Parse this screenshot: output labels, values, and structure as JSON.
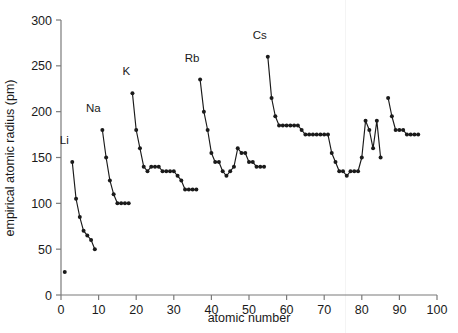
{
  "chart_data": {
    "type": "scatter",
    "title": "",
    "xlabel": "atomic number",
    "ylabel": "empirical atomic radius (pm)",
    "xlim": [
      0,
      100
    ],
    "ylim": [
      0,
      300
    ],
    "xticks": [
      0,
      10,
      20,
      30,
      40,
      50,
      60,
      70,
      80,
      90,
      100
    ],
    "yticks": [
      0,
      50,
      100,
      150,
      200,
      250,
      300
    ],
    "xtick_labels": [
      "0",
      "10",
      "20",
      "30",
      "40",
      "50",
      "60",
      "70",
      "80",
      "90",
      "100"
    ],
    "ytick_labels": [
      "0",
      "50",
      "100",
      "150",
      "200",
      "250",
      "300"
    ],
    "grid": false,
    "legend": null,
    "marker": "filled-circle",
    "marker_color": "#1a1a1a",
    "line_color": "#1a1a1a",
    "axis_color": "#7b7b7b",
    "annotations": [
      {
        "text": "Li",
        "x": 3,
        "y": 145,
        "dx": -8,
        "dy": -18
      },
      {
        "text": "Na",
        "x": 11,
        "y": 180,
        "dx": -9,
        "dy": -18
      },
      {
        "text": "K",
        "x": 19,
        "y": 220,
        "dx": -6,
        "dy": -18
      },
      {
        "text": "Rb",
        "x": 37,
        "y": 235,
        "dx": -8,
        "dy": -18
      },
      {
        "text": "Cs",
        "x": 55,
        "y": 260,
        "dx": -8,
        "dy": -18
      }
    ],
    "series": [
      {
        "name": "hydrogen",
        "connected": false,
        "points": [
          [
            1,
            25
          ]
        ]
      },
      {
        "name": "period-2",
        "connected": true,
        "points": [
          [
            3,
            145
          ],
          [
            4,
            105
          ],
          [
            5,
            85
          ],
          [
            6,
            70
          ],
          [
            7,
            65
          ],
          [
            8,
            60
          ],
          [
            9,
            50
          ]
        ]
      },
      {
        "name": "period-3",
        "connected": true,
        "points": [
          [
            11,
            180
          ],
          [
            12,
            150
          ],
          [
            13,
            125
          ],
          [
            14,
            110
          ],
          [
            15,
            100
          ],
          [
            16,
            100
          ],
          [
            17,
            100
          ],
          [
            18,
            100
          ]
        ]
      },
      {
        "name": "period-4",
        "connected": true,
        "points": [
          [
            19,
            220
          ],
          [
            20,
            180
          ],
          [
            21,
            160
          ],
          [
            22,
            140
          ],
          [
            23,
            135
          ],
          [
            24,
            140
          ],
          [
            25,
            140
          ],
          [
            26,
            140
          ],
          [
            27,
            135
          ],
          [
            28,
            135
          ],
          [
            29,
            135
          ],
          [
            30,
            135
          ],
          [
            31,
            130
          ],
          [
            32,
            125
          ],
          [
            33,
            115
          ],
          [
            34,
            115
          ],
          [
            35,
            115
          ],
          [
            36,
            115
          ]
        ]
      },
      {
        "name": "period-5",
        "connected": true,
        "points": [
          [
            37,
            235
          ],
          [
            38,
            200
          ],
          [
            39,
            180
          ],
          [
            40,
            155
          ],
          [
            41,
            145
          ],
          [
            42,
            145
          ],
          [
            43,
            135
          ],
          [
            44,
            130
          ],
          [
            45,
            135
          ],
          [
            46,
            140
          ],
          [
            47,
            160
          ],
          [
            48,
            155
          ],
          [
            49,
            155
          ],
          [
            50,
            145
          ],
          [
            51,
            145
          ],
          [
            52,
            140
          ],
          [
            53,
            140
          ],
          [
            54,
            140
          ]
        ]
      },
      {
        "name": "period-6",
        "connected": true,
        "points": [
          [
            55,
            260
          ],
          [
            56,
            215
          ],
          [
            57,
            195
          ],
          [
            58,
            185
          ],
          [
            59,
            185
          ],
          [
            60,
            185
          ],
          [
            61,
            185
          ],
          [
            62,
            185
          ],
          [
            63,
            185
          ],
          [
            64,
            180
          ],
          [
            65,
            175
          ],
          [
            66,
            175
          ],
          [
            67,
            175
          ],
          [
            68,
            175
          ],
          [
            69,
            175
          ],
          [
            70,
            175
          ],
          [
            71,
            175
          ],
          [
            72,
            155
          ],
          [
            73,
            145
          ],
          [
            74,
            135
          ],
          [
            75,
            135
          ],
          [
            76,
            130
          ],
          [
            77,
            135
          ],
          [
            78,
            135
          ],
          [
            79,
            135
          ],
          [
            80,
            150
          ],
          [
            81,
            190
          ],
          [
            82,
            180
          ],
          [
            83,
            160
          ],
          [
            84,
            190
          ],
          [
            85,
            150
          ]
        ]
      },
      {
        "name": "period-7",
        "connected": true,
        "points": [
          [
            87,
            215
          ],
          [
            88,
            195
          ],
          [
            89,
            180
          ],
          [
            90,
            180
          ],
          [
            91,
            180
          ],
          [
            92,
            175
          ],
          [
            93,
            175
          ],
          [
            94,
            175
          ],
          [
            95,
            175
          ]
        ]
      }
    ]
  },
  "figure": {
    "background_color": "#ffffff",
    "width": 458,
    "height": 333
  }
}
